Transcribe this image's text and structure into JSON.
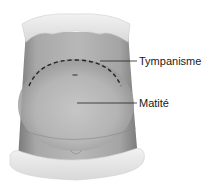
{
  "diagram": {
    "labels": [
      {
        "text": "Tympanisme"
      },
      {
        "text": "Matité"
      }
    ]
  }
}
